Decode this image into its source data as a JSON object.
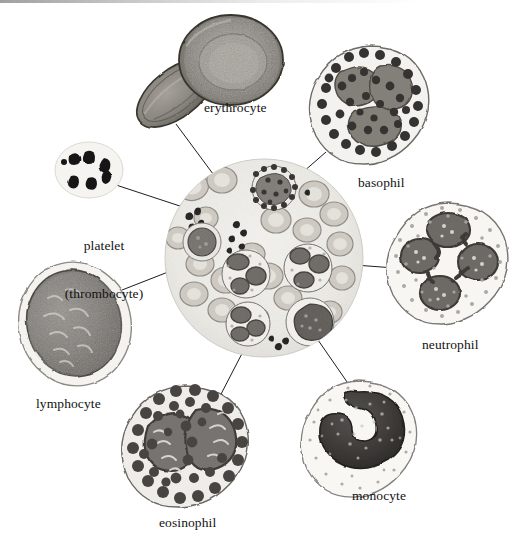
{
  "figure": {
    "style": "grayscale pen-and-ink / halftone scientific illustration",
    "background_color": "#ffffff",
    "ink_color": "#121212",
    "has_scan_edge_artifact": true
  },
  "central_smear": {
    "name": "blood smear field",
    "shape": "circle",
    "center": [
      264,
      258
    ],
    "radius": 100,
    "fill_color": "#efeeea",
    "contents_summary": "many biconcave erythrocytes, several leukocytes, platelet clusters"
  },
  "labels": [
    {
      "id": "erythrocyte",
      "text": "erythrocyte",
      "x": 204,
      "y": 100,
      "lines": [
        "erythrocyte"
      ]
    },
    {
      "id": "basophil",
      "text": "basophil",
      "x": 358,
      "y": 175,
      "lines": [
        "basophil"
      ]
    },
    {
      "id": "platelet",
      "text": "platelet (thrombocyte)",
      "x": 44,
      "y": 206,
      "lines": [
        "platelet",
        "(thrombocyte)"
      ]
    },
    {
      "id": "neutrophil",
      "text": "neutrophil",
      "x": 422,
      "y": 337,
      "lines": [
        "neutrophil"
      ]
    },
    {
      "id": "lymphocyte",
      "text": "lymphocyte",
      "x": 36,
      "y": 396,
      "lines": [
        "lymphocyte"
      ]
    },
    {
      "id": "monocyte",
      "text": "monocyte",
      "x": 352,
      "y": 488,
      "lines": [
        "monocyte"
      ]
    },
    {
      "id": "eosinophil",
      "text": "eosinophil",
      "x": 159,
      "y": 515,
      "lines": [
        "eosinophil"
      ]
    }
  ],
  "cells": [
    {
      "id": "erythrocyte",
      "label": "erythrocyte",
      "category": "red blood cell",
      "count_shown": 2,
      "orientation": "one face-on with central pallor, one edge-on",
      "nucleus": "none",
      "granules": "none",
      "cytoplasm_color": "#8d8a86",
      "outline_color": "#3a3a3a"
    },
    {
      "id": "basophil",
      "label": "basophil",
      "category": "granulocyte",
      "nucleus": "bilobed, largely obscured",
      "granules": "coarse, dense, very dark",
      "granule_color": "#3b3b3b",
      "nucleus_color": "#7e7b78",
      "cytoplasm_color": "#f2f1ee"
    },
    {
      "id": "platelet",
      "label": "platelet (thrombocyte)",
      "category": "cell fragment",
      "count_shown": 6,
      "nucleus": "none",
      "granules": "dark irregular bodies",
      "granule_color": "#1b1b1b",
      "cytoplasm_color": "#f4f3f0"
    },
    {
      "id": "neutrophil",
      "label": "neutrophil",
      "category": "granulocyte",
      "nucleus": "multilobed, 4 lobes connected by strands",
      "granules": "fine, pale, sparse",
      "nucleus_color": "#595652",
      "granule_color": "#9d9a95",
      "cytoplasm_color": "#f6f5f2"
    },
    {
      "id": "lymphocyte",
      "label": "lymphocyte",
      "category": "agranulocyte",
      "nucleus": "large round, fills most of cell",
      "granules": "none",
      "nucleus_color": "#7b7874",
      "cytoplasm_color": "#f3f2ef"
    },
    {
      "id": "monocyte",
      "label": "monocyte",
      "category": "agranulocyte",
      "nucleus": "kidney / horseshoe shaped",
      "granules": "very fine, sparse",
      "nucleus_color": "#3d3b38",
      "cytoplasm_color": "#f7f6f3"
    },
    {
      "id": "eosinophil",
      "label": "eosinophil",
      "category": "granulocyte",
      "nucleus": "bilobed",
      "granules": "large, round, uniform, dark",
      "granule_color": "#4a4744",
      "nucleus_color": "#6e6b67",
      "cytoplasm_color": "#efeeeb"
    }
  ],
  "leader_lines": [
    {
      "from": "erythrocyte",
      "to": "central_smear",
      "x1": 176,
      "y1": 124,
      "x2": 216,
      "y2": 178
    },
    {
      "from": "platelet",
      "to": "central_smear",
      "x1": 113,
      "y1": 184,
      "x2": 189,
      "y2": 209
    },
    {
      "from": "lymphocyte",
      "to": "central_smear",
      "x1": 122,
      "y1": 290,
      "x2": 186,
      "y2": 265
    },
    {
      "from": "basophil",
      "to": "central_smear",
      "x1": 326,
      "y1": 152,
      "x2": 295,
      "y2": 179
    },
    {
      "from": "neutrophil",
      "to": "central_smear",
      "x1": 395,
      "y1": 268,
      "x2": 341,
      "y2": 264
    },
    {
      "from": "monocyte",
      "to": "central_smear",
      "x1": 354,
      "y1": 392,
      "x2": 318,
      "y2": 340
    },
    {
      "from": "eosinophil",
      "to": "central_smear",
      "x1": 219,
      "y1": 398,
      "x2": 249,
      "y2": 340
    }
  ]
}
